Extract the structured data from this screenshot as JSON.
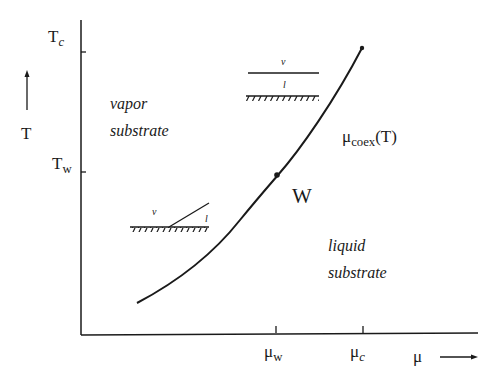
{
  "diagram": {
    "type": "phase-diagram",
    "axes": {
      "y_label": "T",
      "x_label": "μ",
      "y_ticks": [
        {
          "label_main": "T",
          "label_sub": "c",
          "y": 52
        },
        {
          "label_main": "T",
          "label_sub": "w",
          "y": 172
        }
      ],
      "x_ticks": [
        {
          "label_main": "μ",
          "label_sub": "w",
          "x": 276
        },
        {
          "label_main": "μ",
          "label_sub": "c",
          "x": 362
        }
      ]
    },
    "curve": {
      "label_main": "μ",
      "label_sub": "coex",
      "label_suffix": "(T)",
      "critical_point_label": "",
      "wetting_point_label": "W"
    },
    "regions": {
      "vapor": {
        "line1": "vapor",
        "line2": "substrate"
      },
      "liquid": {
        "line1": "liquid",
        "line2": "substrate"
      }
    },
    "insets": {
      "wet": {
        "top_phase": "v",
        "bottom_phase": "l"
      },
      "partial": {
        "top_phase": "v",
        "bottom_phase": "l"
      }
    },
    "colors": {
      "ink": "#1a1a1a",
      "background": "#ffffff"
    }
  }
}
